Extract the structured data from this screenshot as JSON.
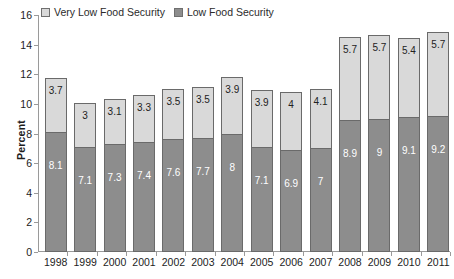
{
  "legend": {
    "position": "top-left",
    "entries": [
      {
        "label": "Very Low Food Security",
        "color": "#d9d9d9",
        "key": "very_low"
      },
      {
        "label": "Low Food Security",
        "color": "#8d8d8d",
        "key": "low"
      }
    ]
  },
  "axes": {
    "ylabel": "Percent",
    "yticks": [
      "0",
      "2",
      "4",
      "6",
      "8",
      "10",
      "12",
      "14",
      "16"
    ],
    "xlabel": ""
  },
  "chart_data": {
    "type": "bar",
    "stacked": true,
    "title": "",
    "subtitle": "",
    "xlabel": "",
    "ylabel": "Percent",
    "ylim": [
      0,
      16
    ],
    "ytick_step": 2,
    "grid": false,
    "legend_position": "top-left",
    "categories": [
      "1998",
      "1999",
      "2000",
      "2001",
      "2002",
      "2003",
      "2004",
      "2005",
      "2006",
      "2007",
      "2008",
      "2009",
      "2010",
      "2011"
    ],
    "series": [
      {
        "name": "Low Food Security",
        "color": "#8d8d8d",
        "values": [
          8.1,
          7.1,
          7.3,
          7.4,
          7.6,
          7.7,
          8,
          7.1,
          6.9,
          7,
          8.9,
          9,
          9.1,
          9.2
        ],
        "labels": [
          "8.1",
          "7.1",
          "7.3",
          "7.4",
          "7.6",
          "7.7",
          "8",
          "7.1",
          "6.9",
          "7",
          "8.9",
          "9",
          "9.1",
          "9.2"
        ]
      },
      {
        "name": "Very Low Food Security",
        "color": "#d9d9d9",
        "values": [
          3.7,
          3,
          3.1,
          3.3,
          3.5,
          3.5,
          3.9,
          3.9,
          4,
          4.1,
          5.7,
          5.7,
          5.4,
          5.7
        ],
        "labels": [
          "3.7",
          "3",
          "3.1",
          "3.3",
          "3.5",
          "3.5",
          "3.9",
          "3.9",
          "4",
          "4.1",
          "5.7",
          "5.7",
          "5.4",
          "5.7"
        ]
      }
    ],
    "totals": [
      11.8,
      10.1,
      10.4,
      10.7,
      11.1,
      11.2,
      11.9,
      11.0,
      10.9,
      11.1,
      14.6,
      14.7,
      14.5,
      14.9
    ]
  }
}
